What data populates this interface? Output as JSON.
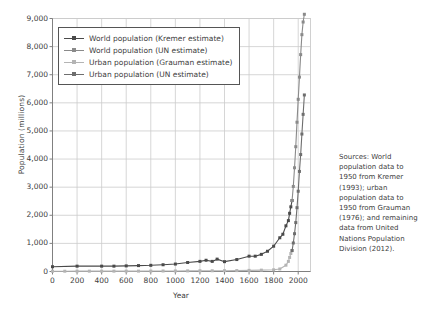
{
  "chart_data": {
    "type": "line",
    "title": "",
    "xlabel": "Year",
    "ylabel": "Population (millions)",
    "xlim": [
      0,
      2100
    ],
    "ylim": [
      0,
      9000
    ],
    "grid": true,
    "legend_position": "upper left",
    "x_ticks": [
      0,
      200,
      400,
      600,
      800,
      1000,
      1200,
      1400,
      1600,
      1800,
      2000
    ],
    "x_tick_labels": [
      "0",
      "200",
      "400",
      "600",
      "800",
      "1000",
      "1200",
      "1400",
      "1600",
      "1800",
      "2000"
    ],
    "y_ticks": [
      0,
      1000,
      2000,
      3000,
      4000,
      5000,
      6000,
      7000,
      8000,
      9000
    ],
    "y_tick_labels": [
      "0",
      "1,000",
      "2,000",
      "3,000",
      "4,000",
      "5,000",
      "6,000",
      "7,000",
      "8,000",
      "9,000"
    ],
    "annotation": "Sources: World population data to 1950 from Kremer (1993); urban population data to 1950 from Grauman (1976); and remaining data from United Nations Population Division (2012).",
    "series": [
      {
        "name": "World population (Kremer estimate)",
        "color": "#4a4a4a",
        "marker": "square",
        "x": [
          0,
          200,
          400,
          500,
          600,
          700,
          800,
          900,
          1000,
          1100,
          1200,
          1250,
          1300,
          1340,
          1400,
          1500,
          1600,
          1650,
          1700,
          1750,
          1800,
          1850,
          1875,
          1900,
          1920,
          1930,
          1940,
          1950
        ],
        "y": [
          170,
          190,
          190,
          190,
          200,
          210,
          220,
          240,
          265,
          320,
          360,
          400,
          360,
          440,
          350,
          425,
          545,
          545,
          610,
          720,
          900,
          1200,
          1325,
          1625,
          1810,
          2070,
          2300,
          2525
        ]
      },
      {
        "name": "World population (UN estimate)",
        "color": "#8a8a8a",
        "marker": "square",
        "x": [
          1950,
          1960,
          1970,
          1980,
          1990,
          2000,
          2010,
          2020,
          2030,
          2040,
          2050
        ],
        "y": [
          2525,
          3025,
          3690,
          4440,
          5310,
          6125,
          6915,
          7715,
          8425,
          8875,
          9150
        ]
      },
      {
        "name": "Urban population (Grauman estimate)",
        "color": "#b4b4b4",
        "marker": "square",
        "x": [
          0,
          100,
          200,
          300,
          400,
          500,
          600,
          700,
          800,
          900,
          1000,
          1100,
          1200,
          1300,
          1400,
          1500,
          1600,
          1700,
          1800,
          1850,
          1900,
          1920,
          1930,
          1940,
          1950
        ],
        "y": [
          10,
          10,
          12,
          12,
          12,
          12,
          14,
          14,
          16,
          18,
          20,
          22,
          26,
          26,
          28,
          32,
          40,
          48,
          60,
          90,
          225,
          360,
          500,
          640,
          745
        ]
      },
      {
        "name": "Urban population (UN estimate)",
        "color": "#6e6e6e",
        "marker": "square",
        "x": [
          1950,
          1960,
          1970,
          1980,
          1990,
          2000,
          2010,
          2020,
          2030,
          2040,
          2050
        ],
        "y": [
          745,
          1015,
          1345,
          1740,
          2270,
          2855,
          3560,
          4160,
          4890,
          5590,
          6280
        ]
      }
    ]
  },
  "axes": {
    "y_title": "Population (millions)",
    "x_title": "Year"
  },
  "legend": {
    "items": [
      {
        "label": "World population (Kremer estimate)",
        "color": "#4a4a4a"
      },
      {
        "label": "World population (UN estimate)",
        "color": "#8a8a8a"
      },
      {
        "label": "Urban population (Grauman estimate)",
        "color": "#b4b4b4"
      },
      {
        "label": "Urban population (UN estimate)",
        "color": "#6e6e6e"
      }
    ]
  },
  "sources": {
    "text": "Sources: World population data to 1950 from Kremer (1993); urban population data to 1950 from Grauman (1976); and remaining data from United Nations Population Division (2012)."
  },
  "colors": {
    "grid": "#cccccc",
    "axis": "#808080",
    "text": "#404040",
    "background": "#ffffff"
  }
}
